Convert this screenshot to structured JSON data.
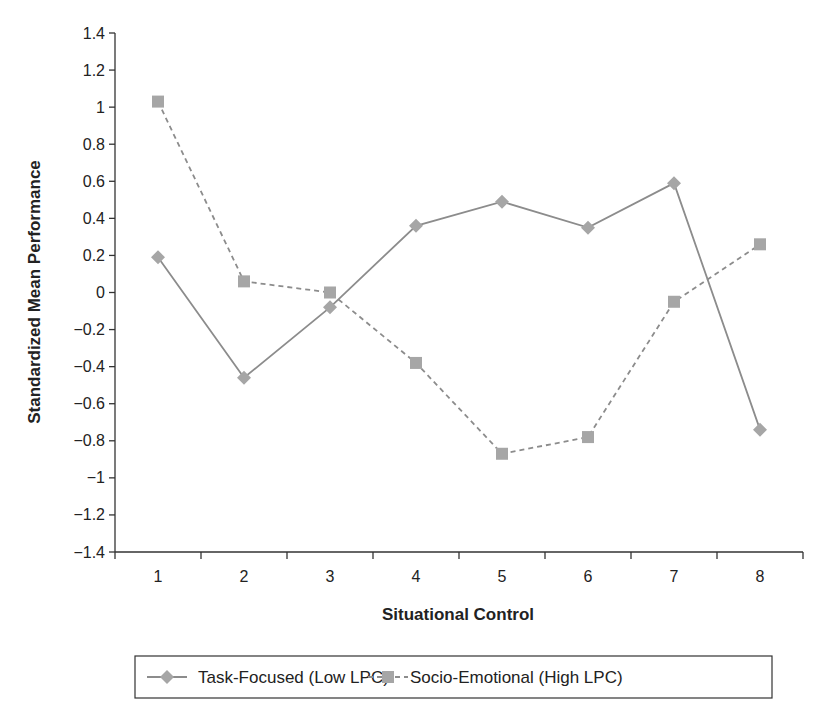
{
  "chart_data": {
    "type": "line",
    "title": "",
    "xlabel": "Situational Control",
    "ylabel": "Standardized Mean Performance",
    "categories": [
      "1",
      "2",
      "3",
      "4",
      "5",
      "6",
      "7",
      "8"
    ],
    "ylim": [
      -1.4,
      1.4
    ],
    "yticks": [
      1.4,
      1.2,
      1,
      0.8,
      0.6,
      0.4,
      0.2,
      0,
      -0.2,
      -0.4,
      -0.6,
      -0.8,
      -1,
      -1.2,
      -1.4
    ],
    "ytick_labels": [
      "1.4",
      "1.2",
      "1",
      "0.8",
      "0.6",
      "0.4",
      "0.2",
      "0",
      "−0.2",
      "−0.4",
      "−0.6",
      "−0.8",
      "−1",
      "−1.2",
      "−1.4"
    ],
    "grid": false,
    "legend_position": "bottom",
    "series": [
      {
        "name": "Task-Focused (Low LPC)",
        "marker": "diamond",
        "line_style": "solid",
        "color": "#8c8c8c",
        "values": [
          0.19,
          -0.46,
          -0.08,
          0.36,
          0.49,
          0.35,
          0.59,
          -0.74
        ]
      },
      {
        "name": "Socio-Emotional (High LPC)",
        "marker": "square",
        "line_style": "dashed",
        "color": "#8c8c8c",
        "values": [
          1.03,
          0.06,
          0.0,
          -0.38,
          -0.87,
          -0.78,
          -0.05,
          0.26
        ]
      }
    ]
  },
  "colors": {
    "axis": "#333333",
    "series_line": "#8c8c8c",
    "marker_fill": "#a6a6a6",
    "text": "#222222"
  }
}
